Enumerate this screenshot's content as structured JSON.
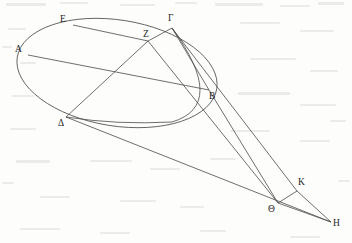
{
  "figure": {
    "background_color": "#fdfdfc",
    "stroke_color": "#4a4a4a",
    "label_color": "#1d1d1d",
    "width": 352,
    "height": 243
  },
  "points": [
    {
      "id": "A",
      "label": "Α",
      "x": 28,
      "y": 55,
      "label_x": 15,
      "label_y": 45
    },
    {
      "id": "E",
      "label": "Ε",
      "x": 73,
      "y": 25,
      "label_x": 60,
      "label_y": 15
    },
    {
      "id": "Gamma",
      "label": "Γ",
      "x": 172,
      "y": 28,
      "label_x": 168,
      "label_y": 14
    },
    {
      "id": "Z",
      "label": "Ζ",
      "x": 148,
      "y": 41,
      "label_x": 143,
      "label_y": 30
    },
    {
      "id": "B",
      "label": "Β",
      "x": 209,
      "y": 90,
      "label_x": 209,
      "label_y": 92
    },
    {
      "id": "Delta",
      "label": "Δ",
      "x": 66,
      "y": 117,
      "label_x": 58,
      "label_y": 119
    },
    {
      "id": "Theta",
      "label": "Θ",
      "x": 278,
      "y": 203,
      "label_x": 268,
      "label_y": 205
    },
    {
      "id": "K",
      "label": "Κ",
      "x": 297,
      "y": 191,
      "label_x": 298,
      "label_y": 178
    },
    {
      "id": "H",
      "label": "Η",
      "x": 331,
      "y": 222,
      "label_x": 333,
      "label_y": 219
    }
  ],
  "ellipse": {
    "name": "main-ellipse",
    "center_x": 117,
    "center_y": 73,
    "radius_x": 101,
    "radius_y": 53,
    "rotation_deg": 9
  },
  "arc": {
    "name": "inner-arc",
    "description": "arc from Gamma curving down through the ellipse interior past B to Delta",
    "start_x": 172,
    "start_y": 28,
    "control_x": 228,
    "control_y": 105,
    "mid_x": 172,
    "mid_y": 122,
    "end_x": 66,
    "end_y": 117
  },
  "segments": [
    {
      "name": "segment-A-B",
      "from": "A",
      "to": "B",
      "x1": 28,
      "y1": 55,
      "x2": 209,
      "y2": 90
    },
    {
      "name": "segment-E-Z",
      "from": "E",
      "to": "Z",
      "x1": 73,
      "y1": 25,
      "x2": 148,
      "y2": 41
    },
    {
      "name": "segment-Z-Gamma",
      "from": "Z",
      "to": "Gamma",
      "x1": 148,
      "y1": 41,
      "x2": 172,
      "y2": 28
    },
    {
      "name": "segment-Delta-Z",
      "from": "Delta",
      "to": "Z",
      "x1": 66,
      "y1": 117,
      "x2": 148,
      "y2": 41
    },
    {
      "name": "segment-Z-Theta",
      "from": "Z",
      "to": "Theta",
      "x1": 148,
      "y1": 41,
      "x2": 278,
      "y2": 203
    },
    {
      "name": "segment-Gamma-B",
      "from": "Gamma",
      "to": "B",
      "x1": 172,
      "y1": 28,
      "x2": 209,
      "y2": 90
    },
    {
      "name": "segment-B-Theta",
      "from": "B",
      "to": "Theta",
      "x1": 209,
      "y1": 90,
      "x2": 278,
      "y2": 203
    },
    {
      "name": "segment-Gamma-K",
      "from": "Gamma",
      "to": "K",
      "x1": 172,
      "y1": 28,
      "x2": 297,
      "y2": 191
    },
    {
      "name": "segment-K-H",
      "from": "K",
      "to": "H",
      "x1": 297,
      "y1": 191,
      "x2": 331,
      "y2": 222
    },
    {
      "name": "segment-Theta-K",
      "from": "Theta",
      "to": "K",
      "x1": 278,
      "y1": 203,
      "x2": 297,
      "y2": 191
    },
    {
      "name": "segment-Delta-H",
      "from": "Delta",
      "to": "H",
      "x1": 66,
      "y1": 117,
      "x2": 331,
      "y2": 222
    },
    {
      "name": "segment-Theta-H",
      "from": "Theta",
      "to": "H",
      "x1": 278,
      "y1": 203,
      "x2": 331,
      "y2": 222
    }
  ]
}
